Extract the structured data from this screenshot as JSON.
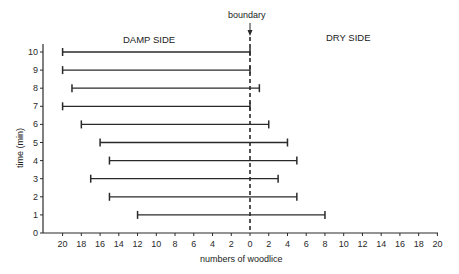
{
  "chart_data": {
    "type": "bar",
    "orientation": "horizontal-range",
    "title": "",
    "xlabel": "numbers of woodlice",
    "ylabel": "time (min)",
    "annotations": {
      "boundary": "boundary",
      "left_region": "DAMP SIDE",
      "right_region": "DRY SIDE"
    },
    "x_ticks": [
      "20",
      "18",
      "16",
      "14",
      "12",
      "10",
      "8",
      "6",
      "4",
      "2",
      "0",
      "2",
      "4",
      "6",
      "8",
      "10",
      "12",
      "14",
      "16",
      "18",
      "20"
    ],
    "y_ticks": [
      "0",
      "1",
      "2",
      "3",
      "4",
      "5",
      "6",
      "7",
      "8",
      "9",
      "10"
    ],
    "xlim": [
      -20,
      20
    ],
    "ylim": [
      0,
      10
    ],
    "grid": false,
    "legend": null,
    "categories": [
      "1",
      "2",
      "3",
      "4",
      "5",
      "6",
      "7",
      "8",
      "9",
      "10"
    ],
    "series": [
      {
        "name": "damp side",
        "values": [
          12,
          15,
          17,
          15,
          16,
          18,
          20,
          19,
          20,
          20
        ]
      },
      {
        "name": "dry side",
        "values": [
          8,
          5,
          3,
          5,
          4,
          2,
          0,
          1,
          0,
          0
        ]
      }
    ]
  }
}
